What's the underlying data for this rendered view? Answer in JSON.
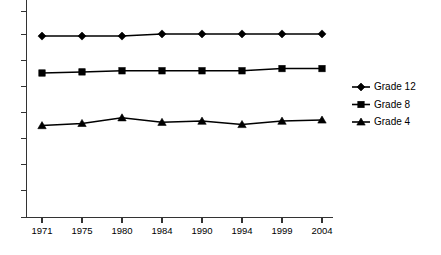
{
  "chart_data": {
    "type": "line",
    "title": "",
    "subtitle": "",
    "xlabel": "",
    "ylabel": "",
    "categories": [
      "1971",
      "1975",
      "1980",
      "1984",
      "1990",
      "1994",
      "1999",
      "2004"
    ],
    "series": [
      {
        "name": "Grade 12",
        "marker": "diamond",
        "values": [
          288,
          288,
          288,
          290,
          290,
          290,
          290,
          290
        ]
      },
      {
        "name": "Grade 8",
        "marker": "square",
        "values": [
          255,
          256,
          257,
          257,
          257,
          257,
          259,
          259
        ]
      },
      {
        "name": "Grade 4",
        "marker": "triangle",
        "values": [
          208,
          210,
          215,
          211,
          212,
          209,
          212,
          213
        ]
      }
    ],
    "ylim": [
      150,
      310
    ],
    "y_tick_count": 7,
    "y_tick_labels_visible": false,
    "grid": false,
    "legend_position": "right",
    "line_color": "#000000",
    "marker_color": "#000000",
    "axis_color": "#333333",
    "background_color": "#ffffff"
  },
  "legend": {
    "entries": [
      {
        "label": "Grade 12",
        "marker": "diamond-marker-icon"
      },
      {
        "label": "Grade 8",
        "marker": "square-marker-icon"
      },
      {
        "label": "Grade 4",
        "marker": "triangle-marker-icon"
      }
    ]
  },
  "xaxis": {
    "ticks": [
      "1971",
      "1975",
      "1980",
      "1984",
      "1990",
      "1994",
      "1999",
      "2004"
    ]
  }
}
